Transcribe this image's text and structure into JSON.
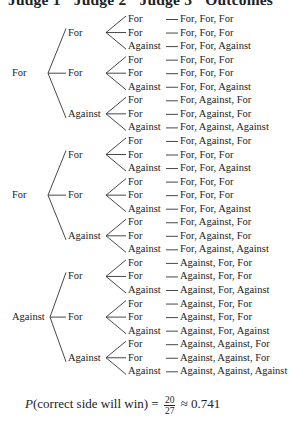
{
  "header": {
    "columns": [
      "Judge 1",
      "Judge 2",
      "Judge 3",
      "Outcomes"
    ]
  },
  "tree": {
    "judge1": [
      {
        "label": "For",
        "row": 4
      },
      {
        "label": "For",
        "row": 13
      },
      {
        "label": "Against",
        "row": 22
      }
    ],
    "judge2": [
      {
        "label": "For",
        "row": 1,
        "parent": 0
      },
      {
        "label": "For",
        "row": 4,
        "parent": 0
      },
      {
        "label": "Against",
        "row": 7,
        "parent": 0
      },
      {
        "label": "For",
        "row": 10,
        "parent": 1
      },
      {
        "label": "For",
        "row": 13,
        "parent": 1
      },
      {
        "label": "Against",
        "row": 16,
        "parent": 1
      },
      {
        "label": "For",
        "row": 19,
        "parent": 2
      },
      {
        "label": "For",
        "row": 22,
        "parent": 2
      },
      {
        "label": "Against",
        "row": 25,
        "parent": 2
      }
    ],
    "judge3": [
      "For",
      "For",
      "Against",
      "For",
      "For",
      "Against",
      "For",
      "For",
      "Against",
      "For",
      "For",
      "Against",
      "For",
      "For",
      "Against",
      "For",
      "For",
      "Against",
      "For",
      "For",
      "Against",
      "For",
      "For",
      "Against",
      "For",
      "For",
      "Against"
    ],
    "outcomes": [
      "For, For, For",
      "For, For, For",
      "For, For, Against",
      "For, For, For",
      "For, For, For",
      "For, For, Against",
      "For, Against, For",
      "For, Against, For",
      "For, Against, Against",
      "For, Against, For",
      "For, For, For",
      "For, For, Against",
      "For, For, For",
      "For, For, For",
      "For, For, Against",
      "For, Against, For",
      "For, Against, For",
      "For, Against, Against",
      "Against, For, For",
      "Against, For, For",
      "Against, For, Against",
      "Against, For, For",
      "Against, For, For",
      "Against, For, Against",
      "Against, Against, For",
      "Against, Against, For",
      "Against, Against, Against"
    ]
  },
  "formula": {
    "lhs_P": "P",
    "lhs_rest": "(correct side will win) =",
    "numerator": "20",
    "denominator": "27",
    "approx": "≈ 0.741"
  }
}
